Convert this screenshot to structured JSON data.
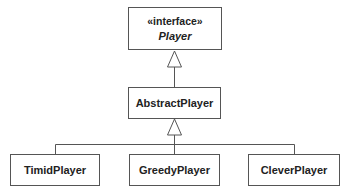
{
  "diagram": {
    "type": "UML class diagram",
    "interface": {
      "stereotype": "«interface»",
      "name": "Player"
    },
    "abstract_class": {
      "name": "AbstractPlayer"
    },
    "subclasses": [
      {
        "name": "TimidPlayer"
      },
      {
        "name": "GreedyPlayer"
      },
      {
        "name": "CleverPlayer"
      }
    ],
    "relationships": [
      {
        "from": "AbstractPlayer",
        "to": "Player",
        "kind": "realization/generalization"
      },
      {
        "from": "TimidPlayer",
        "to": "AbstractPlayer",
        "kind": "generalization"
      },
      {
        "from": "GreedyPlayer",
        "to": "AbstractPlayer",
        "kind": "generalization"
      },
      {
        "from": "CleverPlayer",
        "to": "AbstractPlayer",
        "kind": "generalization"
      }
    ],
    "colors": {
      "line": "#555555",
      "text": "#222222",
      "background": "#ffffff"
    }
  }
}
